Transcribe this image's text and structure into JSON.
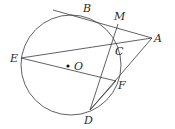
{
  "diagram": {
    "type": "geometry",
    "stroke_color": "#3a3a3a",
    "circle": {
      "center_label": "O",
      "cx": 71,
      "cy": 65,
      "r": 50
    },
    "points": {
      "A": {
        "label": "A",
        "x": 152,
        "y": 38
      },
      "B": {
        "label": "B",
        "x": 88,
        "y": 15
      },
      "C": {
        "label": "C",
        "x": 112,
        "y": 43
      },
      "D": {
        "label": "D",
        "x": 90,
        "y": 110
      },
      "E": {
        "label": "E",
        "x": 21,
        "y": 58
      },
      "F": {
        "label": "F",
        "x": 116,
        "y": 81
      },
      "M": {
        "label": "M",
        "x": 118,
        "y": 24
      },
      "O": {
        "label": "O",
        "x": 68,
        "y": 66
      }
    },
    "segments": [
      [
        "tangent-start",
        "A"
      ],
      [
        "E",
        "A"
      ],
      [
        "E",
        "F"
      ],
      [
        "D",
        "M"
      ],
      [
        "D",
        "A"
      ],
      [
        "D",
        "F"
      ]
    ]
  }
}
